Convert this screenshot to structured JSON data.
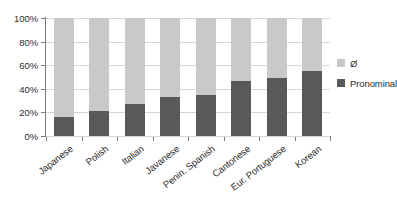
{
  "chart_data": {
    "type": "bar",
    "stacked": true,
    "title": "",
    "xlabel": "",
    "ylabel": "",
    "ylim": [
      0,
      100
    ],
    "ytick_labels": [
      "100%",
      "80%",
      "60%",
      "40%",
      "20%",
      "0%"
    ],
    "ytick_values": [
      100,
      80,
      60,
      40,
      20,
      0
    ],
    "grid": true,
    "legend_position": "right",
    "categories": [
      "Japanese",
      "Polish",
      "Italian",
      "Javanese",
      "Penin. Spanish",
      "Cantonese",
      "Eur. Portuguese",
      "Korean"
    ],
    "series": [
      {
        "name": "Pronominal",
        "color": "#595959",
        "values": [
          16,
          21,
          27,
          33,
          35,
          47,
          49,
          55
        ]
      },
      {
        "name": "Ø",
        "color": "#c9c9c9",
        "values": [
          84,
          79,
          73,
          67,
          65,
          53,
          51,
          45
        ]
      }
    ]
  },
  "legend": {
    "items": [
      {
        "label": "Ø",
        "color": "#c9c9c9"
      },
      {
        "label": "Pronominal",
        "color": "#595959"
      }
    ]
  },
  "colors": {
    "null_series": "#c9c9c9",
    "pronominal_series": "#595959",
    "gridline": "#d6d6d6",
    "axis": "#7a7a7a",
    "text": "#2b2b2b",
    "background": "#ffffff"
  }
}
